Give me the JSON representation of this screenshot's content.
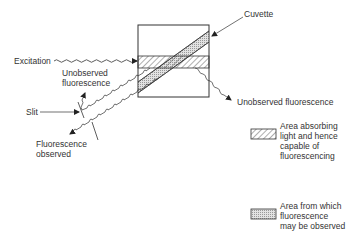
{
  "labels": {
    "cuvette": "Cuvette",
    "excitation": "Excitation",
    "unobserved_left_1": "Unobserved",
    "unobserved_left_2": "fluorescence",
    "slit": "Slit",
    "observed_1": "Fluorescence",
    "observed_2": "observed",
    "unobserved_right": "Unobserved fluorescence"
  },
  "legend": {
    "items": [
      {
        "pattern": "hatched",
        "line1": "Area absorbing",
        "line2": "light and hence",
        "line3": "capable of",
        "line4": "fluorescencing"
      },
      {
        "pattern": "stippled",
        "line1": "Area from which",
        "line2": "fluorescence",
        "line3": "may be observed"
      }
    ]
  },
  "colors": {
    "line": "#333333",
    "stipple": "#c8c8c8",
    "background": "#ffffff"
  }
}
